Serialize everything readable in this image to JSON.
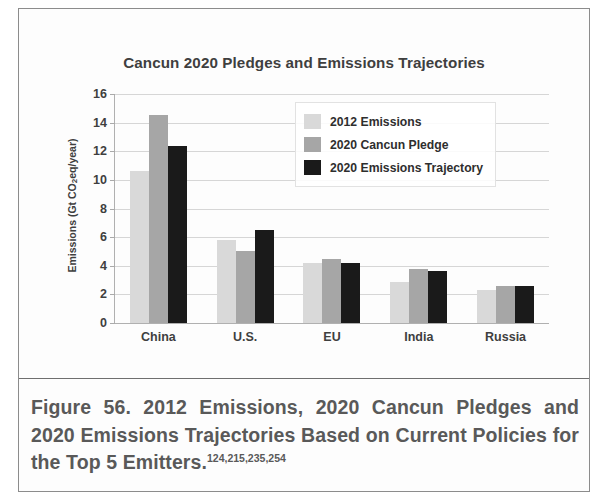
{
  "figure": {
    "caption_text": "Figure 56. 2012 Emissions, 2020 Cancun Pledges and 2020 Emissions Trajectories Based on Current Policies for the Top 5 Emitters.",
    "caption_citations": "124,215,235,254"
  },
  "colors": {
    "series_2012": "#d9d9d9",
    "series_pledge": "#a6a6a6",
    "series_trajectory": "#1a1a1a",
    "text": "#3f3f3f",
    "caption_text": "#595959",
    "gridline": "#d6d6d6",
    "axis": "#b0b0b0",
    "frame": "#8c8c8c"
  },
  "chart_data": {
    "type": "bar",
    "title": "Cancun 2020 Pledges and Emissions Trajectories",
    "xlabel": "",
    "ylabel": "Emissions (Gt CO2eq/year)",
    "ylabel_parts": {
      "prefix": "Emissions (Gt CO",
      "subscript": "2",
      "suffix": "eq/year)"
    },
    "categories": [
      "China",
      "U.S.",
      "EU",
      "India",
      "Russia"
    ],
    "series": [
      {
        "name": "2012 Emissions",
        "values": [
          10.6,
          5.8,
          4.2,
          2.9,
          2.3
        ]
      },
      {
        "name": "2020 Cancun Pledge",
        "values": [
          14.5,
          5.0,
          4.5,
          3.8,
          2.6
        ]
      },
      {
        "name": "2020 Emissions Trajectory",
        "values": [
          12.4,
          6.5,
          4.2,
          3.6,
          2.6
        ]
      }
    ],
    "ylim": [
      0,
      16
    ],
    "yticks": [
      0,
      2,
      4,
      6,
      8,
      10,
      12,
      14,
      16
    ],
    "ytick_labels": [
      "0",
      "2",
      "4",
      "6",
      "8",
      "10",
      "12",
      "14",
      "16"
    ],
    "grid": true,
    "legend_position": "upper-center-right"
  }
}
